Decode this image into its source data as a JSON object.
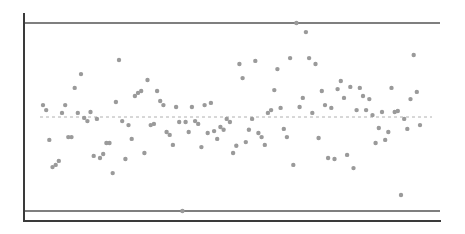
{
  "chart_data": {
    "type": "scatter",
    "subtype": "control-chart",
    "title": "",
    "xlabel": "",
    "ylabel": "",
    "grid": false,
    "legend": null,
    "xlim": [
      1,
      120
    ],
    "ylim": [
      -3.3,
      3.3
    ],
    "reference_lines": {
      "ucl": 3.0,
      "center": 0.0,
      "lcl": -3.0
    },
    "colors": {
      "points": "#9a9a9a",
      "limits": "#555555",
      "center": "#b0b0b0",
      "axes": "#3a3a3a"
    },
    "x": [
      1,
      2,
      3,
      4,
      5,
      6,
      7,
      8,
      9,
      10,
      11,
      12,
      13,
      14,
      15,
      16,
      17,
      18,
      19,
      20,
      21,
      22,
      23,
      24,
      25,
      26,
      27,
      28,
      29,
      30,
      31,
      32,
      33,
      34,
      35,
      36,
      37,
      38,
      39,
      40,
      41,
      42,
      43,
      44,
      45,
      46,
      47,
      48,
      49,
      50,
      51,
      52,
      53,
      54,
      55,
      56,
      57,
      58,
      59,
      60,
      61,
      62,
      63,
      64,
      65,
      66,
      67,
      68,
      69,
      70,
      71,
      72,
      73,
      74,
      75,
      76,
      77,
      78,
      79,
      80,
      81,
      82,
      83,
      84,
      85,
      86,
      87,
      88,
      89,
      90,
      91,
      92,
      93,
      94,
      95,
      96,
      97,
      98,
      99,
      100,
      101,
      102,
      103,
      104,
      105,
      106,
      107,
      108,
      109,
      110,
      111,
      112,
      113,
      114,
      115,
      116,
      117,
      118,
      119,
      120
    ],
    "y": [
      0.38,
      0.22,
      -0.73,
      -1.6,
      -1.53,
      -1.4,
      0.13,
      0.38,
      -0.64,
      -0.64,
      0.93,
      0.13,
      1.37,
      -0.03,
      -0.13,
      0.16,
      -1.24,
      -0.06,
      -1.31,
      -1.18,
      -0.83,
      -0.83,
      -1.79,
      0.48,
      1.82,
      -0.13,
      -1.34,
      -0.26,
      -0.7,
      0.67,
      0.77,
      0.83,
      -1.15,
      1.18,
      -0.26,
      -0.22,
      0.83,
      0.51,
      0.38,
      -0.48,
      -0.57,
      -0.89,
      0.32,
      -0.16,
      -3.0,
      -0.16,
      -0.48,
      0.32,
      -0.13,
      -0.22,
      -0.96,
      0.38,
      -0.51,
      0.45,
      -0.45,
      -0.7,
      -0.32,
      -0.41,
      -0.06,
      -0.16,
      -1.15,
      -0.92,
      1.69,
      1.24,
      -0.8,
      -0.41,
      -0.06,
      1.79,
      -0.51,
      -0.64,
      -0.89,
      0.13,
      0.22,
      0.86,
      1.53,
      0.29,
      -0.38,
      -0.64,
      1.88,
      -1.53,
      3.0,
      0.32,
      0.61,
      2.71,
      1.88,
      0.13,
      1.69,
      -0.67,
      0.83,
      0.38,
      -1.31,
      0.29,
      -1.34,
      0.89,
      1.15,
      0.61,
      -1.21,
      0.96,
      -1.63,
      0.22,
      0.93,
      0.67,
      0.22,
      0.57,
      0.06,
      -0.83,
      -0.35,
      0.16,
      -0.73,
      -0.48,
      0.93,
      0.16,
      0.19,
      -2.49,
      -0.06,
      -0.38,
      0.57,
      1.98,
      0.8,
      -0.26
    ]
  }
}
